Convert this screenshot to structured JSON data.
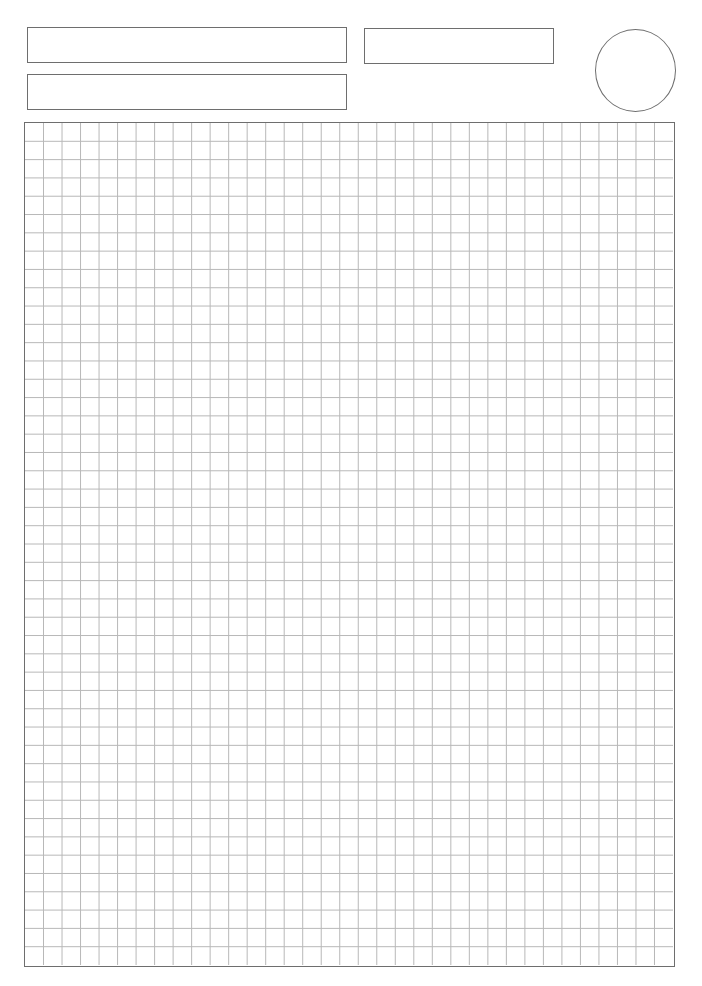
{
  "header": {
    "fields": [
      {
        "name": "name-field",
        "value": ""
      },
      {
        "name": "date-field",
        "value": ""
      },
      {
        "name": "title-field",
        "value": ""
      }
    ],
    "stamp_circle": {
      "value": ""
    }
  },
  "grid": {
    "columns": 35,
    "rows": 46,
    "line_color": "#b8b8b8",
    "border_color": "#6e6e6e"
  }
}
